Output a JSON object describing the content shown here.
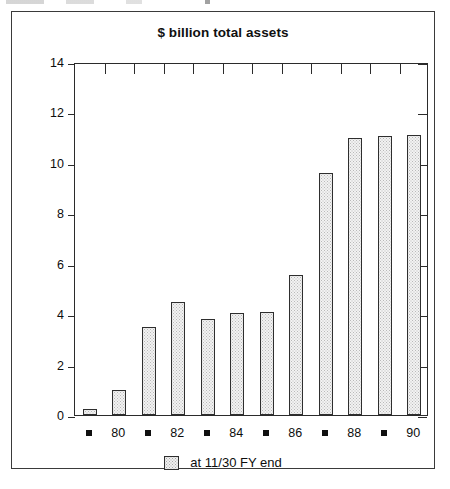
{
  "figure": {
    "title": "$ billion total assets",
    "legend_label": "at 11/30 FY end",
    "legend_swatch": "dotted-square-swatch"
  },
  "chart_data": {
    "type": "bar",
    "title": "$ billion total assets",
    "xlabel": "",
    "ylabel": "",
    "ylim": [
      0,
      14
    ],
    "yticks": [
      0,
      2,
      4,
      6,
      8,
      10,
      12,
      14
    ],
    "grid": false,
    "legend": [
      "at 11/30 FY end"
    ],
    "legend_position": "bottom-center",
    "categories": [
      "79",
      "80",
      "81",
      "82",
      "83",
      "84",
      "85",
      "86",
      "87",
      "88",
      "89",
      "90"
    ],
    "tick_labels_shown": [
      "",
      "80",
      "",
      "82",
      "",
      "84",
      "",
      "86",
      "",
      "88",
      "",
      "90"
    ],
    "values": [
      0.25,
      1.0,
      3.5,
      4.5,
      3.8,
      4.05,
      4.1,
      5.55,
      9.6,
      11.0,
      11.05,
      11.1
    ],
    "series": [
      {
        "name": "at 11/30 FY end",
        "values": [
          0.25,
          1.0,
          3.5,
          4.5,
          3.8,
          4.05,
          4.1,
          5.55,
          9.6,
          11.0,
          11.05,
          11.1
        ]
      }
    ],
    "colors": {
      "bar_fill": "#f2f2f2",
      "bar_pattern": "#b9b9b9",
      "bar_outline": "#2e2e2e",
      "axis": "#2b2b2b",
      "text": "#0d0d0d"
    }
  }
}
